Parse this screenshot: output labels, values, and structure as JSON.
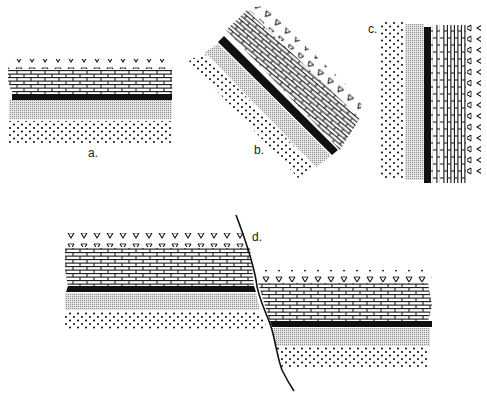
{
  "figure": {
    "labels": {
      "a": "a.",
      "b": "b.",
      "c": "c.",
      "d": "d."
    },
    "layers_top_to_bottom": [
      {
        "id": "volcanics",
        "pattern": "v-symbols"
      },
      {
        "id": "limestone",
        "pattern": "brick"
      },
      {
        "id": "coal",
        "pattern": "solid-black"
      },
      {
        "id": "shale",
        "pattern": "fine-stipple"
      },
      {
        "id": "sandstone",
        "pattern": "dots"
      }
    ],
    "colors": {
      "ink": "#111111",
      "stipple": "#9a9a9a",
      "background": "#ffffff"
    },
    "panels": [
      {
        "id": "a",
        "state": "horizontal"
      },
      {
        "id": "b",
        "state": "tilted"
      },
      {
        "id": "c",
        "state": "vertical"
      },
      {
        "id": "d",
        "state": "faulted"
      }
    ]
  }
}
